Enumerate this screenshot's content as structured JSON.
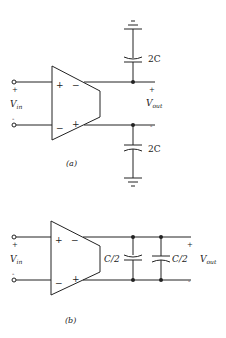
{
  "figure_a": {
    "caption": "(a)",
    "input_label": "V",
    "input_sub": "in",
    "output_label": "V",
    "output_sub": "out",
    "in_plus": "+",
    "in_minus": "-",
    "out_plus": "+",
    "out_minus": "-",
    "opamp_in_plus": "+",
    "opamp_in_minus": "−",
    "opamp_out_minus": "−",
    "opamp_out_plus": "+",
    "cap_top_label": "2C",
    "cap_bottom_label": "2C"
  },
  "figure_b": {
    "caption": "(b)",
    "input_label": "V",
    "input_sub": "in",
    "output_label": "V",
    "output_sub": "out",
    "in_plus": "+",
    "in_minus": "-",
    "out_plus": "+",
    "out_minus": "-",
    "opamp_in_plus": "+",
    "opamp_in_minus": "−",
    "opamp_out_minus": "−",
    "opamp_out_plus": "+",
    "cap_left_label": "C/2",
    "cap_right_label": "C/2"
  }
}
